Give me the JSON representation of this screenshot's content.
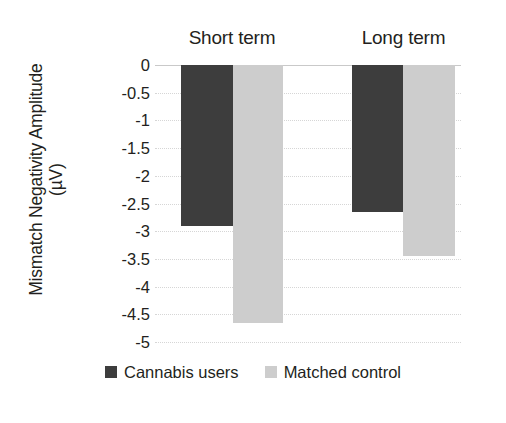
{
  "chart_data": {
    "type": "bar",
    "title": "",
    "xlabel": "",
    "ylabel": "Mismatch Negativity Amplitude (µV)",
    "ylabel_line1": "Mismatch Negativity Amplitude",
    "ylabel_line2": "(µV)",
    "categories": [
      "Short term",
      "Long term"
    ],
    "series": [
      {
        "name": "Cannabis users",
        "color": "#3d3d3d",
        "values": [
          -2.9,
          -2.65
        ]
      },
      {
        "name": "Matched control",
        "color": "#cdcdcd",
        "values": [
          -4.65,
          -3.45
        ]
      }
    ],
    "ylim": [
      -5,
      0
    ],
    "ytick_values": [
      0,
      -0.5,
      -1,
      -1.5,
      -2,
      -2.5,
      -3,
      -3.5,
      -4,
      -4.5,
      -5
    ],
    "ytick_labels": [
      "0",
      "-0.5",
      "-1",
      "-1.5",
      "-2",
      "-2.5",
      "-3",
      "-3.5",
      "-4",
      "-4.5",
      "-5"
    ],
    "grid": true,
    "grid_color": "#d6d6d6",
    "legend_position": "bottom",
    "bar_direction": "downward",
    "background": "#ffffff"
  },
  "legend": {
    "items": [
      {
        "label": "Cannabis users",
        "swatch": "dark-swatch"
      },
      {
        "label": "Matched control",
        "swatch": "light-swatch"
      }
    ]
  }
}
